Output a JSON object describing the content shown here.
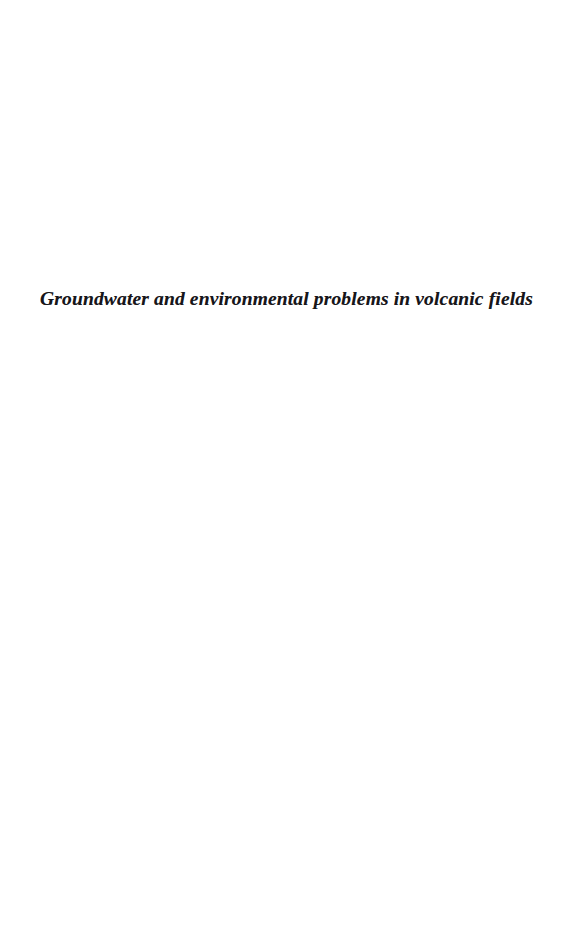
{
  "page": {
    "kind": "book-part-title-page",
    "background_color": "#ffffff",
    "ink_color": "#17161a",
    "width": 573,
    "height": 926
  },
  "content": {
    "part_title": "Groundwater and environmental problems in volcanic fields"
  }
}
